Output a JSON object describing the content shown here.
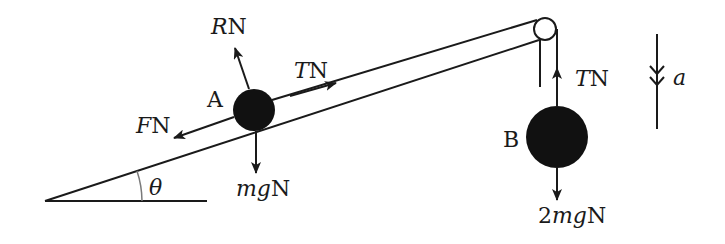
{
  "diagram": {
    "colors": {
      "ink": "#1a1a1a",
      "ball": "#111111",
      "angle_arc": "#7a7a7a",
      "background": "#ffffff"
    },
    "particle_a": {
      "label": "A",
      "forces": {
        "normal": {
          "symbol": "R",
          "unit": "N"
        },
        "tension": {
          "symbol": "T",
          "unit": "N"
        },
        "friction": {
          "symbol": "F",
          "unit": "N"
        },
        "weight": {
          "symbol": "mg",
          "unit": "N"
        }
      }
    },
    "particle_b": {
      "label": "B",
      "forces": {
        "tension": {
          "symbol": "T",
          "unit": "N"
        },
        "weight": {
          "prefix": "2",
          "symbol": "mg",
          "unit": "N"
        }
      }
    },
    "acceleration": {
      "symbol": "a",
      "direction": "down"
    },
    "incline": {
      "angle_symbol": "θ"
    },
    "pulley": {
      "label": ""
    }
  }
}
